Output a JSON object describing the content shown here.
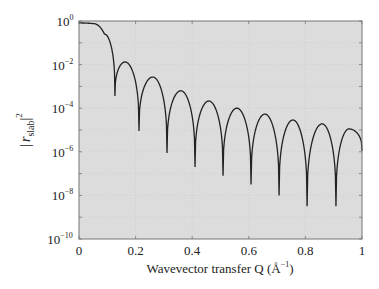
{
  "chart_data": {
    "type": "line",
    "title": "",
    "xlabel": "Wavevector transfer Q (Å⁻¹)",
    "xlabel_parts": {
      "main": "Wavevector transfer Q (Å",
      "sup": "−1",
      "close": ")"
    },
    "ylabel": "|r_slab|^2",
    "ylabel_parts": {
      "bar_left": "|",
      "r": "r",
      "sub": "slab",
      "bar_right": "|",
      "sup": "2"
    },
    "xlim": [
      0,
      1
    ],
    "ylim": [
      1e-10,
      1
    ],
    "yscale": "log",
    "grid": true,
    "legend": null,
    "x_ticks": [
      {
        "value": 0,
        "label": "0"
      },
      {
        "value": 0.2,
        "label": "0.2"
      },
      {
        "value": 0.4,
        "label": "0.4"
      },
      {
        "value": 0.6,
        "label": "0.6"
      },
      {
        "value": 0.8,
        "label": "0.8"
      },
      {
        "value": 1,
        "label": "1"
      }
    ],
    "y_ticks": [
      {
        "exp": 0,
        "base": "10",
        "sup": "0"
      },
      {
        "exp": -2,
        "base": "10",
        "sup": "−2"
      },
      {
        "exp": -4,
        "base": "10",
        "sup": "−4"
      },
      {
        "exp": -6,
        "base": "10",
        "sup": "−6"
      },
      {
        "exp": -8,
        "base": "10",
        "sup": "−8"
      },
      {
        "exp": -10,
        "base": "10",
        "sup": "−10"
      }
    ],
    "series": [
      {
        "name": "|r_slab|^2",
        "color": "#222222",
        "key_points_log10": [
          {
            "q": 0.0,
            "log_r2": -0.09
          },
          {
            "q": 0.05,
            "log_r2": -0.12
          },
          {
            "q": 0.09,
            "log_r2": -0.6
          },
          {
            "q": 0.127,
            "log_r2": -3.44
          },
          {
            "q": 0.163,
            "log_r2": -1.88
          },
          {
            "q": 0.212,
            "log_r2": -5.05
          },
          {
            "q": 0.261,
            "log_r2": -2.57
          },
          {
            "q": 0.311,
            "log_r2": -6.05
          },
          {
            "q": 0.36,
            "log_r2": -3.2
          },
          {
            "q": 0.41,
            "log_r2": -6.7
          },
          {
            "q": 0.459,
            "log_r2": -3.67
          },
          {
            "q": 0.509,
            "log_r2": -7.1
          },
          {
            "q": 0.558,
            "log_r2": -4.0
          },
          {
            "q": 0.608,
            "log_r2": -7.5
          },
          {
            "q": 0.657,
            "log_r2": -4.27
          },
          {
            "q": 0.707,
            "log_r2": -8.0
          },
          {
            "q": 0.756,
            "log_r2": -4.54
          },
          {
            "q": 0.806,
            "log_r2": -8.5
          },
          {
            "q": 0.859,
            "log_r2": -4.72
          },
          {
            "q": 0.908,
            "log_r2": -8.5
          },
          {
            "q": 0.954,
            "log_r2": -4.95
          },
          {
            "q": 1.0,
            "log_r2": -5.96
          }
        ]
      }
    ]
  },
  "colors": {
    "plot_bg": "#dcdcdc",
    "axis": "#777777",
    "grid": "#c4c4c4",
    "line": "#222222"
  }
}
